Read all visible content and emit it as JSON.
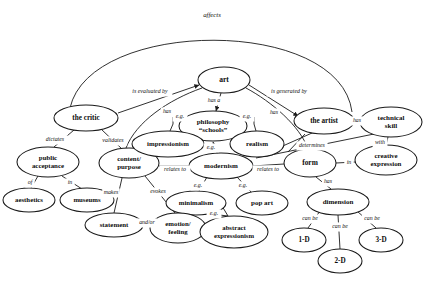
{
  "diagram": {
    "title": "affects",
    "type": "concept-map",
    "background_color": "#ffffff",
    "stroke_color": "#1a1a1a",
    "text_color": "#0d0d0d"
  },
  "nodes": [
    {
      "id": "art",
      "label": "art",
      "label2": "",
      "cx": 224,
      "cy": 80,
      "rx": 26,
      "ry": 13,
      "fs": 7.6
    },
    {
      "id": "the-critic",
      "label": "the critic",
      "label2": "",
      "cx": 86,
      "cy": 118,
      "rx": 32,
      "ry": 13,
      "fs": 7.2
    },
    {
      "id": "the-artist",
      "label": "the artist",
      "label2": "",
      "cx": 324,
      "cy": 121,
      "rx": 30,
      "ry": 13,
      "fs": 7.2
    },
    {
      "id": "technical-skill",
      "label": "technical",
      "label2": "skill",
      "cx": 391,
      "cy": 122,
      "rx": 31,
      "ry": 15,
      "fs": 7.0
    },
    {
      "id": "philosophy-schools",
      "label": "philosophy",
      "label2": "“schools”",
      "cx": 213,
      "cy": 126,
      "rx": 34,
      "ry": 15,
      "fs": 7.0
    },
    {
      "id": "public-acceptance",
      "label": "public",
      "label2": "acceptance",
      "cx": 48,
      "cy": 162,
      "rx": 31,
      "ry": 15,
      "fs": 6.9
    },
    {
      "id": "content-purpose",
      "label": "content/",
      "label2": "purpose",
      "cx": 129,
      "cy": 163,
      "rx": 30,
      "ry": 15,
      "fs": 6.9
    },
    {
      "id": "impressionism",
      "label": "impressionism",
      "label2": "",
      "cx": 168,
      "cy": 144,
      "rx": 36,
      "ry": 13,
      "fs": 6.8
    },
    {
      "id": "realism",
      "label": "realism",
      "label2": "",
      "cx": 257,
      "cy": 144,
      "rx": 27,
      "ry": 13,
      "fs": 7.0
    },
    {
      "id": "modernism",
      "label": "modernism",
      "label2": "",
      "cx": 221,
      "cy": 166,
      "rx": 32,
      "ry": 13,
      "fs": 7.0
    },
    {
      "id": "form",
      "label": "form",
      "label2": "",
      "cx": 310,
      "cy": 163,
      "rx": 26,
      "ry": 14,
      "fs": 7.4
    },
    {
      "id": "creative-expression",
      "label": "creative",
      "label2": "expression",
      "cx": 386,
      "cy": 160,
      "rx": 31,
      "ry": 15,
      "fs": 6.9
    },
    {
      "id": "aesthetics",
      "label": "aesthetics",
      "label2": "",
      "cx": 29,
      "cy": 200,
      "rx": 26,
      "ry": 12,
      "fs": 6.8
    },
    {
      "id": "museums",
      "label": "museums",
      "label2": "",
      "cx": 87,
      "cy": 200,
      "rx": 27,
      "ry": 12,
      "fs": 6.8
    },
    {
      "id": "minimalism",
      "label": "minimalism",
      "label2": "",
      "cx": 196,
      "cy": 203,
      "rx": 30,
      "ry": 12,
      "fs": 6.8
    },
    {
      "id": "pop-art",
      "label": "pop art",
      "label2": "",
      "cx": 262,
      "cy": 203,
      "rx": 26,
      "ry": 12,
      "fs": 7.0
    },
    {
      "id": "dimension",
      "label": "dimension",
      "label2": "",
      "cx": 338,
      "cy": 202,
      "rx": 31,
      "ry": 13,
      "fs": 7.0
    },
    {
      "id": "statement",
      "label": "statement",
      "label2": "",
      "cx": 114,
      "cy": 225,
      "rx": 29,
      "ry": 12,
      "fs": 6.9
    },
    {
      "id": "emotion-feeling",
      "label": "emotion/",
      "label2": "feeling",
      "cx": 178,
      "cy": 228,
      "rx": 28,
      "ry": 15,
      "fs": 6.8
    },
    {
      "id": "abstract-expressionism",
      "label": "abstract",
      "label2": "expressionism",
      "cx": 234,
      "cy": 232,
      "rx": 34,
      "ry": 16,
      "fs": 6.7
    },
    {
      "id": "one-d",
      "label": "1-D",
      "label2": "",
      "cx": 304,
      "cy": 240,
      "rx": 22,
      "ry": 12,
      "fs": 7.2
    },
    {
      "id": "two-d",
      "label": "2-D",
      "label2": "",
      "cx": 340,
      "cy": 261,
      "rx": 22,
      "ry": 12,
      "fs": 7.2
    },
    {
      "id": "three-d",
      "label": "3-D",
      "label2": "",
      "cx": 381,
      "cy": 240,
      "rx": 22,
      "ry": 12,
      "fs": 7.2
    }
  ],
  "edges": [
    {
      "id": "affects",
      "label": "affects",
      "from": "the-critic",
      "to": "the-artist",
      "kind": "arc",
      "lx": 212,
      "ly": 15
    },
    {
      "id": "is-evaluated-by",
      "label": "is evaluated by",
      "from": "art",
      "to": "the-critic",
      "kind": "line",
      "lx": 150,
      "ly": 92
    },
    {
      "id": "is-generated-by",
      "label": "is generated by",
      "from": "art",
      "to": "the-artist",
      "kind": "line",
      "lx": 289,
      "ly": 92
    },
    {
      "id": "art-has-a",
      "label": "has a",
      "from": "art",
      "to": "philosophy-schools",
      "kind": "line",
      "lx": 214,
      "ly": 101
    },
    {
      "id": "art-has-left",
      "label": "has",
      "from": "art",
      "to": "content-purpose",
      "kind": "curve",
      "lx": 167,
      "ly": 112
    },
    {
      "id": "art-has-right",
      "label": "has",
      "from": "art",
      "to": "form",
      "kind": "curve",
      "lx": 274,
      "ly": 113
    },
    {
      "id": "critic-dictates",
      "label": "dictates",
      "from": "the-critic",
      "to": "public-acceptance",
      "kind": "line",
      "lx": 55,
      "ly": 140
    },
    {
      "id": "critic-validates",
      "label": "validates",
      "from": "the-critic",
      "to": "content-purpose",
      "kind": "line",
      "lx": 113,
      "ly": 141
    },
    {
      "id": "artist-has",
      "label": "has",
      "from": "the-artist",
      "to": "technical-skill",
      "kind": "line",
      "lx": 357,
      "ly": 121
    },
    {
      "id": "artist-determines",
      "label": "determines",
      "from": "the-artist",
      "to": "form",
      "kind": "line",
      "lx": 312,
      "ly": 146
    },
    {
      "id": "skill-with",
      "label": "with",
      "from": "technical-skill",
      "to": "creative-expression",
      "kind": "line",
      "lx": 380,
      "ly": 143
    },
    {
      "id": "form-in",
      "label": "in",
      "from": "form",
      "to": "creative-expression",
      "kind": "line",
      "lx": 349,
      "ly": 163
    },
    {
      "id": "eg-impressionism",
      "label": "e.g.",
      "from": "philosophy-schools",
      "to": "impressionism",
      "kind": "bracket",
      "lx": 180,
      "ly": 117
    },
    {
      "id": "eg-realism",
      "label": "e.g.",
      "from": "philosophy-schools",
      "to": "realism",
      "kind": "bracket",
      "lx": 247,
      "ly": 117
    },
    {
      "id": "eg-modernism",
      "label": "e.g.",
      "from": "philosophy-schools",
      "to": "modernism",
      "kind": "line",
      "lx": 211,
      "ly": 148
    },
    {
      "id": "pa-of",
      "label": "of",
      "from": "public-acceptance",
      "to": "aesthetics",
      "kind": "line",
      "lx": 30,
      "ly": 183
    },
    {
      "id": "pa-in",
      "label": "in",
      "from": "public-acceptance",
      "to": "museums",
      "kind": "line",
      "lx": 70,
      "ly": 183
    },
    {
      "id": "cp-makes",
      "label": "makes",
      "from": "content-purpose",
      "to": "statement",
      "kind": "line",
      "lx": 111,
      "ly": 193
    },
    {
      "id": "cp-evokes",
      "label": "evokes",
      "from": "content-purpose",
      "to": "emotion-feeling",
      "kind": "line",
      "lx": 158,
      "ly": 192
    },
    {
      "id": "cp-relates-to",
      "label": "relates to",
      "from": "content-purpose",
      "to": "modernism",
      "kind": "line",
      "lx": 175,
      "ly": 170
    },
    {
      "id": "mod-relates-to",
      "label": "relates to",
      "from": "modernism",
      "to": "form",
      "kind": "line",
      "lx": 268,
      "ly": 170
    },
    {
      "id": "eg-minimalism",
      "label": "e.g.",
      "from": "modernism",
      "to": "minimalism",
      "kind": "line",
      "lx": 198,
      "ly": 186
    },
    {
      "id": "eg-pop-art",
      "label": "e.g.",
      "from": "modernism",
      "to": "pop-art",
      "kind": "line",
      "lx": 243,
      "ly": 186
    },
    {
      "id": "eg-abstract",
      "label": "e.g.",
      "from": "minimalism",
      "to": "abstract-expressionism",
      "kind": "line",
      "lx": 214,
      "ly": 214
    },
    {
      "id": "and-or",
      "label": "and/or",
      "from": "statement",
      "to": "emotion-feeling",
      "kind": "line",
      "lx": 147,
      "ly": 223
    },
    {
      "id": "form-has",
      "label": "has",
      "from": "form",
      "to": "dimension",
      "kind": "line",
      "lx": 328,
      "ly": 182
    },
    {
      "id": "can-be-1d",
      "label": "can be",
      "from": "dimension",
      "to": "one-d",
      "kind": "line",
      "lx": 310,
      "ly": 219
    },
    {
      "id": "can-be-2d",
      "label": "can be",
      "from": "dimension",
      "to": "two-d",
      "kind": "line",
      "lx": 340,
      "ly": 227
    },
    {
      "id": "can-be-3d",
      "label": "can be",
      "from": "dimension",
      "to": "three-d",
      "kind": "line",
      "lx": 372,
      "ly": 219
    }
  ]
}
